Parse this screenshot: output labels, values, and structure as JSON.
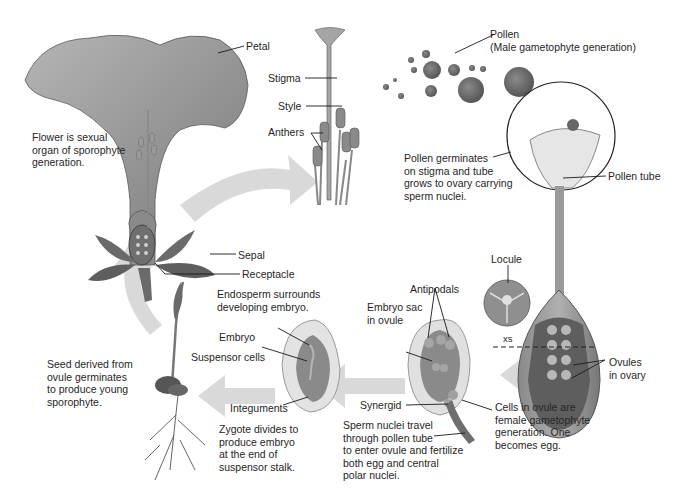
{
  "diagram": {
    "colors": {
      "background": "#ffffff",
      "arrow": "#d6d6d6",
      "tissue_dark": "#6e6e6e",
      "tissue_mid": "#9a9a9a",
      "tissue_light": "#cfcfcf",
      "line": "#1a1a1a"
    },
    "labels": {
      "petal": "Petal",
      "stigma": "Stigma",
      "style": "Style",
      "anthers": "Anthers",
      "flower_note": "Flower is sexual\norgan of sporophyte\ngeneration.",
      "pollen": "Pollen\n(Male gametophyte generation)",
      "pollen_germinates": "Pollen germinates\non stigma and tube\ngrows to ovary carrying\nsperm nuclei.",
      "pollen_tube": "Pollen tube",
      "sepal": "Sepal",
      "receptacle": "Receptacle",
      "locule": "Locule",
      "xs": "xs",
      "ovules_in_ovary": "Ovules\nin ovary",
      "endosperm": "Endosperm surrounds\ndeveloping embryo.",
      "antipodals": "Antipodals",
      "embryo": "Embryo",
      "embryo_sac": "Embryo sac\nin ovule",
      "suspensor_cells": "Suspensor cells",
      "seed_note": "Seed derived from\novule germinates\nto produce young\nsporophyte.",
      "integuments": "Integuments",
      "synergid": "Synergid",
      "cells_in_ovule": "Cells in ovule are\nfemale gametophyte\ngeneration. One\nbecomes egg.",
      "zygote_note": "Zygote divides to\nproduce embryo\nat the end of\nsuspensor stalk.",
      "sperm_note": "Sperm nuclei travel\nthrough pollen tube\nto enter ovule and fertilize\nboth egg and central\npolar nuclei."
    }
  }
}
